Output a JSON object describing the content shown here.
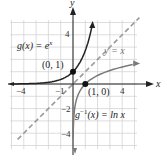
{
  "chart_data": {
    "type": "line",
    "title": "",
    "xlabel": "x",
    "ylabel": "y",
    "xlim": [
      -5,
      5
    ],
    "ylim": [
      -5,
      5
    ],
    "grid": true,
    "x_ticks": [
      -4,
      -1,
      4
    ],
    "y_ticks": [
      4,
      -2,
      -4
    ],
    "x_tick_labels": [
      "-4",
      "-1",
      "4"
    ],
    "y_tick_labels": [
      "4",
      "-2",
      "-4"
    ],
    "series": [
      {
        "name": "g(x) = e^x",
        "label": "g(x) = e",
        "label_sup": "x",
        "style": "solid",
        "color": "#222222",
        "function": "exp",
        "x": [
          -5,
          -4,
          -3,
          -2,
          -1,
          0,
          1,
          1.6
        ],
        "y": [
          0.007,
          0.018,
          0.05,
          0.135,
          0.368,
          1,
          2.718,
          4.95
        ]
      },
      {
        "name": "g^-1(x) = ln x",
        "label_prefix": "g",
        "label_sup": "−1",
        "label_suffix": "(x) = ln x",
        "style": "solid",
        "color": "#777777",
        "function": "ln",
        "x": [
          0.007,
          0.05,
          0.135,
          0.368,
          1,
          2,
          3,
          4,
          5
        ],
        "y": [
          -4.95,
          -3,
          -2,
          -1,
          0,
          0.693,
          1.099,
          1.386,
          1.609
        ]
      },
      {
        "name": "y = x",
        "label": "y = x",
        "style": "dashed",
        "color": "#999999",
        "function": "identity",
        "x": [
          -5,
          5
        ],
        "y": [
          -5,
          5
        ]
      }
    ],
    "annotations": [
      {
        "text": "(0, 1)",
        "x": 0,
        "y": 1,
        "point": true
      },
      {
        "text": "(1, 0)",
        "x": 1,
        "y": 0,
        "point": true
      }
    ]
  },
  "axes": {
    "x_label": "x",
    "y_label": "y"
  },
  "labels": {
    "g": "g(x) = e",
    "g_sup": "x",
    "ginv_prefix": "g",
    "ginv_sup": "−1",
    "ginv_suffix": "(x) = ln x",
    "identity": "y = x",
    "pt1": "(0, 1)",
    "pt2": "(1, 0)"
  },
  "ticks": {
    "xm4": "−4",
    "xm1": "−1",
    "x4": "4",
    "y4": "4",
    "ym2": "−2",
    "ym4": "−4"
  }
}
